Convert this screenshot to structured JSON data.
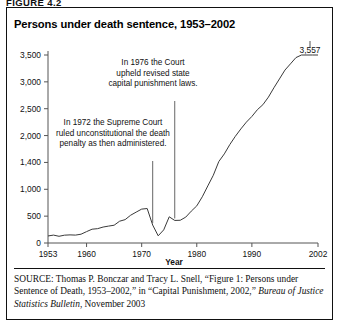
{
  "figure": {
    "number_label": "FIGURE 4.2",
    "title": "Persons under death sentence, 1953–2002"
  },
  "annotations": [
    {
      "id": "annotation-1976",
      "lines": [
        "In 1976 the Court",
        "upheld revised state",
        "capital punishment laws."
      ],
      "leader_year": 1976
    },
    {
      "id": "annotation-1972",
      "lines": [
        "In 1972 the Supreme Court",
        "ruled unconstitutional the death",
        "penalty as then administered."
      ],
      "leader_year": 1972
    }
  ],
  "peak_label": "3,557",
  "source": {
    "prefix": "SOURCE",
    "text_1": ": Thomas P. Bonczar and Tracy L. Snell, “Figure 1: Persons under Sentence of Death, 1953–2002,” in “Capital Punishment, 2002,” ",
    "italic_part": "Bureau of Justice Statistics Bulletin",
    "text_2": ", November 2003"
  },
  "colors": {
    "line": "#3a3a3a",
    "axis": "#555555",
    "text": "#111111",
    "background": "#ffffff"
  },
  "chart_data": {
    "type": "line",
    "title": "Persons under death sentence, 1953–2002",
    "xlabel": "Year",
    "ylabel": "",
    "grid": false,
    "legend": false,
    "xlim": [
      1953,
      2002
    ],
    "ylim": [
      0,
      3700
    ],
    "xticks": [
      1953,
      1960,
      1970,
      1980,
      1990,
      2002
    ],
    "xtick_labels": [
      "1953",
      "1960",
      "1970",
      "1980",
      "1990",
      "2002"
    ],
    "yticks": [
      0,
      500,
      1000,
      1400,
      2000,
      2500,
      3000,
      3500
    ],
    "ytick_labels": [
      "0",
      "500",
      "1,000",
      "1,400",
      "2,000",
      "2,500",
      "3,000",
      "3,500"
    ],
    "series": [
      {
        "name": "Persons under sentence of death",
        "x": [
          1953,
          1954,
          1955,
          1956,
          1957,
          1958,
          1959,
          1960,
          1961,
          1962,
          1963,
          1964,
          1965,
          1966,
          1967,
          1968,
          1969,
          1970,
          1971,
          1972,
          1973,
          1974,
          1975,
          1976,
          1977,
          1978,
          1979,
          1980,
          1981,
          1982,
          1983,
          1984,
          1985,
          1986,
          1987,
          1988,
          1989,
          1990,
          1991,
          1992,
          1993,
          1994,
          1995,
          1996,
          1997,
          1998,
          1999,
          2000,
          2001,
          2002
        ],
        "values": [
          131,
          147,
          125,
          146,
          151,
          147,
          164,
          212,
          257,
          267,
          297,
          315,
          331,
          406,
          435,
          517,
          575,
          631,
          642,
          334,
          134,
          244,
          488,
          420,
          423,
          482,
          593,
          691,
          860,
          1050,
          1209,
          1420,
          1591,
          1800,
          1984,
          2124,
          2250,
          2356,
          2482,
          2575,
          2716,
          2890,
          3054,
          3219,
          3335,
          3452,
          3527,
          3593,
          3577,
          3557
        ],
        "end_label": "3,557"
      }
    ]
  }
}
